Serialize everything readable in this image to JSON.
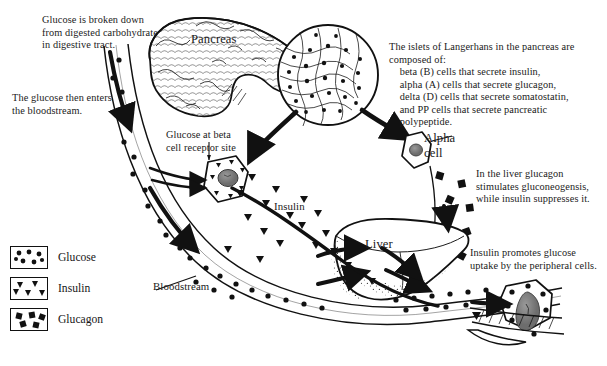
{
  "diagram": {
    "background_color": "#ffffff",
    "ink_color": "#161616"
  },
  "annotations": {
    "intro_glucose_breakdown": "Glucose is broken down\nfrom digested carbohydrate\nin digestive tract.",
    "intro_bloodstream": "The glucose then enters\nthe bloodstream.",
    "islets_description": "The islets of Langerhans in the pancreas are\ncomposed of:\n    beta (B) cells that secrete insulin,\n    alpha (A) cells that secrete glucagon,\n    delta (D) cells that secrete somatostatin,\n    and PP cells that secrete pancreatic\n    polypeptide.",
    "beta_receptor": "Glucose at beta\ncell receptor site",
    "liver_glucagon": "In the liver glucagon\nstimulates gluconeogensis,\nwhile insulin suppresses it.",
    "peripheral_uptake": "Insulin promotes glucose\nuptake by the peripheral cells."
  },
  "structures": {
    "pancreas": "Pancreas",
    "alpha_cell": "Alpha\ncell",
    "liver": "Liver",
    "bloodstream": "Bloodstream",
    "insulin_stream": "Insulin"
  },
  "legend": {
    "items": [
      {
        "label": "Glucose",
        "marker": "circle-marker",
        "marker_shape": "circle"
      },
      {
        "label": "Insulin",
        "marker": "triangle-marker",
        "marker_shape": "triangle"
      },
      {
        "label": "Glucagon",
        "marker": "square-marker",
        "marker_shape": "square"
      }
    ]
  }
}
